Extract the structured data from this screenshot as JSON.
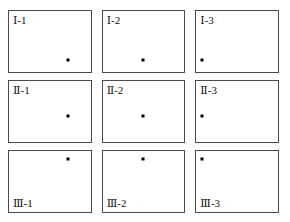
{
  "figure": {
    "background_color": "#ffffff",
    "border_color": "#4a4a4a",
    "marker_color": "#000000",
    "label_color": "#111111",
    "rows": 3,
    "columns": 3,
    "row_labels": [
      "Ⅰ",
      "Ⅱ",
      "Ⅲ"
    ],
    "column_labels": [
      "1",
      "2",
      "3"
    ],
    "label_separator": "-",
    "cells": [
      {
        "id": "cell-1-1",
        "label": "Ⅰ-1",
        "row": 1,
        "column": 1,
        "label_position": "top-left",
        "marker": {
          "x_pct": 72,
          "y_pct": 80
        }
      },
      {
        "id": "cell-1-2",
        "label": "Ⅰ-2",
        "row": 1,
        "column": 2,
        "label_position": "top-left",
        "marker": {
          "x_pct": 50,
          "y_pct": 80
        }
      },
      {
        "id": "cell-1-3",
        "label": "Ⅰ-3",
        "row": 1,
        "column": 3,
        "label_position": "top-left",
        "marker": {
          "x_pct": 7,
          "y_pct": 80
        }
      },
      {
        "id": "cell-2-1",
        "label": "Ⅱ-1",
        "row": 2,
        "column": 1,
        "label_position": "top-left",
        "marker": {
          "x_pct": 72,
          "y_pct": 58
        }
      },
      {
        "id": "cell-2-2",
        "label": "Ⅱ-2",
        "row": 2,
        "column": 2,
        "label_position": "top-left",
        "marker": {
          "x_pct": 50,
          "y_pct": 58
        }
      },
      {
        "id": "cell-2-3",
        "label": "Ⅱ-3",
        "row": 2,
        "column": 3,
        "label_position": "top-left",
        "marker": {
          "x_pct": 7,
          "y_pct": 58
        }
      },
      {
        "id": "cell-3-1",
        "label": "Ⅲ-1",
        "row": 3,
        "column": 1,
        "label_position": "bottom-left",
        "marker": {
          "x_pct": 72,
          "y_pct": 13
        }
      },
      {
        "id": "cell-3-2",
        "label": "Ⅲ-2",
        "row": 3,
        "column": 2,
        "label_position": "bottom-left",
        "marker": {
          "x_pct": 50,
          "y_pct": 13
        }
      },
      {
        "id": "cell-3-3",
        "label": "Ⅲ-3",
        "row": 3,
        "column": 3,
        "label_position": "bottom-left",
        "marker": {
          "x_pct": 7,
          "y_pct": 13
        }
      }
    ]
  }
}
